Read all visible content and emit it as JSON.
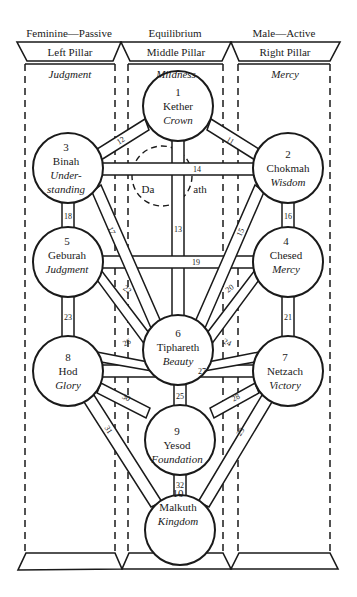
{
  "pillars": [
    {
      "id": "left",
      "polarity": "Feminine—Passive",
      "name": "Left Pillar",
      "quality": "Judgment"
    },
    {
      "id": "middle",
      "polarity": "Equilibrium",
      "name": "Middle Pillar",
      "quality": "Mildness"
    },
    {
      "id": "right",
      "polarity": "Male—Active",
      "name": "Right Pillar",
      "quality": "Mercy"
    }
  ],
  "sephiroth": [
    {
      "number": "1",
      "name": "Kether",
      "meaning": "Crown"
    },
    {
      "number": "2",
      "name": "Chokmah",
      "meaning": "Wisdom"
    },
    {
      "number": "3",
      "name": "Binah",
      "meaning_line1": "Under-",
      "meaning_line2": "standing"
    },
    {
      "number": "4",
      "name": "Chesed",
      "meaning": "Mercy"
    },
    {
      "number": "5",
      "name": "Geburah",
      "meaning": "Judgment"
    },
    {
      "number": "6",
      "name": "Tiphareth",
      "meaning": "Beauty"
    },
    {
      "number": "7",
      "name": "Netzach",
      "meaning": "Victory"
    },
    {
      "number": "8",
      "name": "Hod",
      "meaning": "Glory"
    },
    {
      "number": "9",
      "name": "Yesod",
      "meaning": "Foundation"
    },
    {
      "number": "10",
      "name": "Malkuth",
      "meaning": "Kingdom"
    }
  ],
  "daath": {
    "left": "Da",
    "right": "ath"
  },
  "paths": {
    "p11": "11",
    "p12": "12",
    "p13": "13",
    "p14": "14",
    "p15": "15",
    "p16": "16",
    "p17": "17",
    "p18": "18",
    "p19": "19",
    "p20": "20",
    "p21": "21",
    "p22": "22",
    "p23": "23",
    "p24": "24",
    "p25": "25",
    "p26": "26",
    "p27": "27",
    "p28": "28",
    "p29": "29",
    "p30": "30",
    "p31": "31",
    "p32": "32"
  },
  "colors": {
    "ink": "#1a1a1a",
    "background": "#ffffff"
  }
}
